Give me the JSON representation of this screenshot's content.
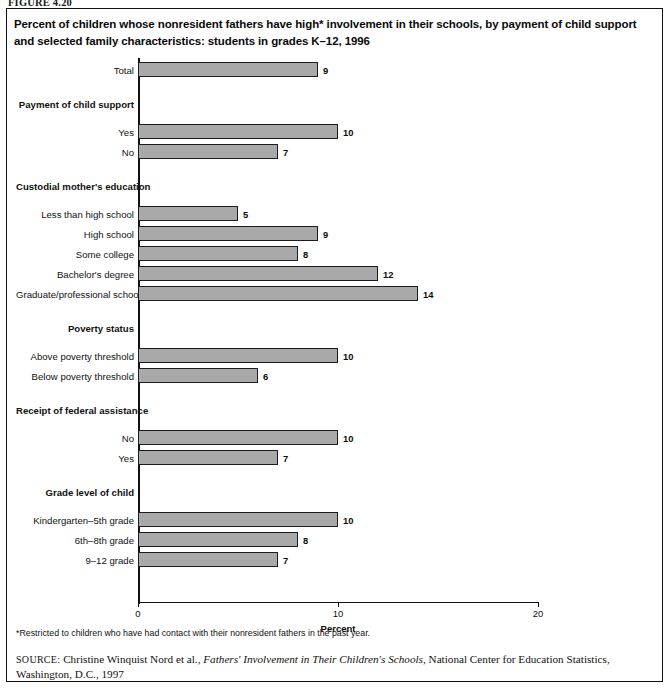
{
  "figure_number": "FIGURE 4.20",
  "title": "Percent of children whose nonresident fathers have high* involvement in their schools, by payment of child support and selected family characteristics: students in grades K–12, 1996",
  "footnote": "*Restricted to children who have had contact with their nonresident fathers in the past year.",
  "source": {
    "label": "SOURCE:",
    "text_before": " Christine Winquist Nord et al., ",
    "italic": "Fathers' Involvement in Their Children's Schools",
    "text_after": ", National Center for Education Statistics, Washington, D.C., 1997"
  },
  "chart_data": {
    "type": "bar",
    "orientation": "horizontal",
    "title": "Percent of children whose nonresident fathers have high* involvement in their schools, by payment of child support and selected family characteristics: students in grades K–12, 1996",
    "xlabel": "Percent",
    "ylabel": "",
    "xlim": [
      0,
      20
    ],
    "xticks": [
      0,
      10,
      20
    ],
    "xtick_labels": [
      "0",
      "10",
      "20"
    ],
    "grid": false,
    "legend": false,
    "bar_color": "#a9a9a9",
    "bar_edge_color": "#1c1c1c",
    "rows": [
      {
        "label": "Total",
        "value": 9,
        "kind": "bar",
        "group": null
      },
      {
        "label": "Payment of child support",
        "value": null,
        "kind": "header"
      },
      {
        "label": "Yes",
        "value": 10,
        "kind": "bar",
        "group": "Payment of child support"
      },
      {
        "label": "No",
        "value": 7,
        "kind": "bar",
        "group": "Payment of child support"
      },
      {
        "label": "Custodial mother's education",
        "value": null,
        "kind": "header"
      },
      {
        "label": "Less than high school",
        "value": 5,
        "kind": "bar",
        "group": "Custodial mother's education"
      },
      {
        "label": "High school",
        "value": 9,
        "kind": "bar",
        "group": "Custodial mother's education"
      },
      {
        "label": "Some college",
        "value": 8,
        "kind": "bar",
        "group": "Custodial mother's education"
      },
      {
        "label": "Bachelor's degree",
        "value": 12,
        "kind": "bar",
        "group": "Custodial mother's education"
      },
      {
        "label": "Graduate/professional school",
        "value": 14,
        "kind": "bar",
        "group": "Custodial mother's education"
      },
      {
        "label": "Poverty status",
        "value": null,
        "kind": "header"
      },
      {
        "label": "Above poverty threshold",
        "value": 10,
        "kind": "bar",
        "group": "Poverty status"
      },
      {
        "label": "Below poverty threshold",
        "value": 6,
        "kind": "bar",
        "group": "Poverty status"
      },
      {
        "label": "Receipt of federal assistance",
        "value": null,
        "kind": "header"
      },
      {
        "label": "No",
        "value": 10,
        "kind": "bar",
        "group": "Receipt of federal assistance"
      },
      {
        "label": "Yes",
        "value": 7,
        "kind": "bar",
        "group": "Receipt of federal assistance"
      },
      {
        "label": "Grade level of child",
        "value": null,
        "kind": "header"
      },
      {
        "label": "Kindergarten–5th grade",
        "value": 10,
        "kind": "bar",
        "group": "Grade level of child"
      },
      {
        "label": "6th–8th grade",
        "value": 8,
        "kind": "bar",
        "group": "Grade level of child"
      },
      {
        "label": "9–12 grade",
        "value": 7,
        "kind": "bar",
        "group": "Grade level of child"
      }
    ],
    "categories": [
      "Total",
      "Yes",
      "No",
      "Less than high school",
      "High school",
      "Some college",
      "Bachelor's degree",
      "Graduate/professional school",
      "Above poverty threshold",
      "Below poverty threshold",
      "No",
      "Yes",
      "Kindergarten–5th grade",
      "6th–8th grade",
      "9–12 grade"
    ],
    "values": [
      9,
      10,
      7,
      5,
      9,
      8,
      12,
      14,
      10,
      6,
      10,
      7,
      10,
      8,
      7
    ]
  }
}
